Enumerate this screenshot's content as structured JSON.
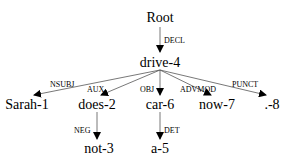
{
  "diagram": {
    "type": "dependency-parse-tree",
    "root": {
      "label": "Root"
    },
    "nodes": [
      {
        "id": "drive",
        "label": "drive-4"
      },
      {
        "id": "sarah",
        "label": "Sarah-1"
      },
      {
        "id": "does",
        "label": "does-2"
      },
      {
        "id": "car",
        "label": "car-6"
      },
      {
        "id": "now",
        "label": "now-7"
      },
      {
        "id": "punct",
        "label": ".-8"
      },
      {
        "id": "not",
        "label": "not-3"
      },
      {
        "id": "a",
        "label": "a-5"
      }
    ],
    "edges": [
      {
        "from": "Root",
        "to": "drive-4",
        "label": "DECL"
      },
      {
        "from": "drive-4",
        "to": "Sarah-1",
        "label": "NSUBJ"
      },
      {
        "from": "drive-4",
        "to": "does-2",
        "label": "AUX"
      },
      {
        "from": "drive-4",
        "to": "car-6",
        "label": "OBJ"
      },
      {
        "from": "drive-4",
        "to": "now-7",
        "label": "ADVMOD"
      },
      {
        "from": "drive-4",
        "to": ".-8",
        "label": "PUNCT"
      },
      {
        "from": "does-2",
        "to": "not-3",
        "label": "NEG"
      },
      {
        "from": "car-6",
        "to": "a-5",
        "label": "DET"
      }
    ]
  }
}
